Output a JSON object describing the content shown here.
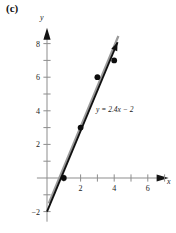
{
  "figure": {
    "part_label": "(c)"
  },
  "chart_data": {
    "type": "scatter",
    "title": "",
    "subtitle": "",
    "xlabel": "x",
    "ylabel": "y",
    "xlim": [
      -0.6,
      7.3
    ],
    "ylim": [
      -2.6,
      9.0
    ],
    "grid": false,
    "legend_position": "none",
    "x_ticks_major": [
      2,
      4,
      6
    ],
    "x_ticks_major_labels": [
      "2",
      "4",
      "6"
    ],
    "x_ticks_minor": [
      1,
      3,
      5,
      7
    ],
    "y_ticks_major": [
      -2,
      2,
      4,
      6,
      8
    ],
    "y_ticks_major_labels": [
      "−2",
      "2",
      "4",
      "6",
      "8"
    ],
    "y_ticks_minor": [
      -1,
      1,
      3,
      5,
      7
    ],
    "points": [
      {
        "x": 1,
        "y": 0
      },
      {
        "x": 2,
        "y": 3
      },
      {
        "x": 3,
        "y": 6
      },
      {
        "x": 4,
        "y": 7
      }
    ],
    "fit_line": {
      "annotation": "y = 2.4x − 2",
      "slope": 2.4,
      "intercept": -2,
      "x_start": 0,
      "x_end": 4.2,
      "arrow_end": true,
      "color": "#101010"
    },
    "shadow_line": {
      "slope": 2.4,
      "intercept": -1.75,
      "x_start": 0.1,
      "x_end": 4.25,
      "color": "#9a9a9a"
    },
    "axis_color": "#8d8d8d",
    "point_color": "#0d0d0d"
  },
  "labels": {
    "x_axis_name": "x",
    "y_axis_name": "y",
    "equation": "y = 2.4x − 2"
  }
}
